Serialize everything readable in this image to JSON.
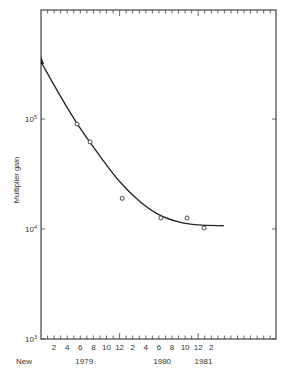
{
  "chart_data": {
    "type": "scatter",
    "title": "",
    "xlabel": "",
    "ylabel": "Multiplier gain",
    "yscale": "log",
    "ylim": [
      1000,
      1000000
    ],
    "y_ticks": [
      {
        "value": 100000,
        "label_base": "10",
        "label_exp": "5"
      },
      {
        "value": 10000,
        "label_base": "10",
        "label_exp": "4"
      },
      {
        "value": 1000,
        "label_base": "10",
        "label_exp": "3"
      }
    ],
    "x_unit": "months since Jan 1979",
    "xlim": [
      0,
      36
    ],
    "x_tick_labels": [
      {
        "month": 2,
        "label": "2"
      },
      {
        "month": 4,
        "label": "4"
      },
      {
        "month": 6,
        "label": "6"
      },
      {
        "month": 8,
        "label": "8"
      },
      {
        "month": 10,
        "label": "10"
      },
      {
        "month": 12,
        "label": "12"
      },
      {
        "month": 14,
        "label": "2"
      },
      {
        "month": 16,
        "label": "4"
      },
      {
        "month": 18,
        "label": "6"
      },
      {
        "month": 20,
        "label": "8"
      },
      {
        "month": 22,
        "label": "10"
      },
      {
        "month": 24,
        "label": "12"
      },
      {
        "month": 26,
        "label": "2"
      }
    ],
    "x_group_labels": [
      {
        "pos": -2.6,
        "label": "New"
      },
      {
        "pos": 6.6,
        "label": "1979"
      },
      {
        "pos": 18.5,
        "label": "1980"
      },
      {
        "pos": 24.8,
        "label": "1981"
      }
    ],
    "series": [
      {
        "name": "Measured gain",
        "marker": "open-circle",
        "points": [
          {
            "month": 5.5,
            "gain": 90000
          },
          {
            "month": 7.5,
            "gain": 62000
          },
          {
            "month": 12.4,
            "gain": 19000
          },
          {
            "month": 18.3,
            "gain": 12600
          },
          {
            "month": 22.3,
            "gain": 12600
          },
          {
            "month": 24.9,
            "gain": 10200
          }
        ]
      },
      {
        "name": "Fitted curve",
        "marker": "line",
        "points": [
          {
            "month": 0,
            "gain": 330000
          },
          {
            "month": 3,
            "gain": 160000
          },
          {
            "month": 6,
            "gain": 82000
          },
          {
            "month": 9,
            "gain": 46000
          },
          {
            "month": 12,
            "gain": 27000
          },
          {
            "month": 15,
            "gain": 18000
          },
          {
            "month": 18,
            "gain": 13500
          },
          {
            "month": 21,
            "gain": 11600
          },
          {
            "month": 24,
            "gain": 10900
          },
          {
            "month": 27.9,
            "gain": 10700
          }
        ]
      }
    ],
    "grid": false,
    "legend": "none"
  }
}
